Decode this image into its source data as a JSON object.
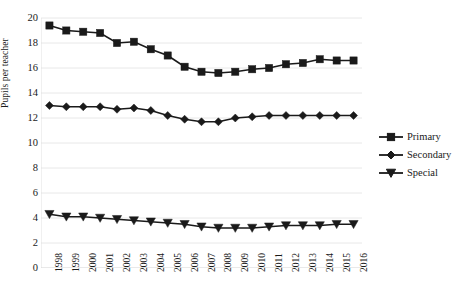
{
  "chart_data": {
    "type": "line",
    "title": "",
    "xlabel": "",
    "ylabel": "Pupils per teacher",
    "x": [
      1998,
      1999,
      2000,
      2001,
      2002,
      2003,
      2004,
      2005,
      2006,
      2007,
      2008,
      2009,
      2010,
      2011,
      2012,
      2013,
      2014,
      2015,
      2016
    ],
    "xtick_labels": [
      "1998",
      "1999",
      "2000",
      "2001",
      "2002",
      "2003",
      "2004",
      "2005",
      "2006",
      "2007",
      "2008",
      "2009",
      "2010",
      "2011",
      "2012",
      "2013",
      "2014",
      "2015",
      "2016"
    ],
    "ytick_labels": [
      "0",
      "2",
      "4",
      "6",
      "8",
      "10",
      "12",
      "14",
      "16",
      "18",
      "20"
    ],
    "ytick_values": [
      0,
      2,
      4,
      6,
      8,
      10,
      12,
      14,
      16,
      18,
      20
    ],
    "ylim": [
      0,
      20
    ],
    "grid": true,
    "grid_axis": "y",
    "legend_position": "right",
    "series": [
      {
        "name": "Primary",
        "marker": "square",
        "color": "#1a1a1a",
        "values": [
          19.4,
          19.0,
          18.9,
          18.8,
          18.0,
          18.1,
          17.5,
          17.0,
          16.1,
          15.7,
          15.6,
          15.7,
          15.9,
          16.0,
          16.3,
          16.4,
          16.7,
          16.6,
          16.6
        ]
      },
      {
        "name": "Secondary",
        "marker": "diamond",
        "color": "#1a1a1a",
        "values": [
          13.0,
          12.9,
          12.9,
          12.9,
          12.7,
          12.8,
          12.6,
          12.2,
          11.9,
          11.7,
          11.7,
          12.0,
          12.1,
          12.2,
          12.2,
          12.2,
          12.2,
          12.2,
          12.2
        ]
      },
      {
        "name": "Special",
        "marker": "triangle-down",
        "color": "#1a1a1a",
        "values": [
          4.3,
          4.1,
          4.1,
          4.0,
          3.9,
          3.8,
          3.7,
          3.6,
          3.5,
          3.3,
          3.2,
          3.2,
          3.2,
          3.3,
          3.4,
          3.4,
          3.4,
          3.5,
          3.5
        ]
      }
    ]
  },
  "axes": {
    "y_title": "Pupils per teacher"
  },
  "legend": {
    "items": [
      {
        "label": "Primary",
        "marker": "square"
      },
      {
        "label": "Secondary",
        "marker": "diamond"
      },
      {
        "label": "Special",
        "marker": "triangle-down"
      }
    ]
  }
}
